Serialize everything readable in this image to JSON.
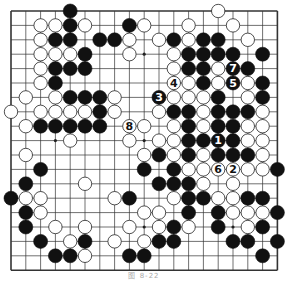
{
  "diagram": {
    "caption": "图 8-22",
    "board_size": 19,
    "visible_cols": 19,
    "visible_rows": 18,
    "grid": {
      "left": 11,
      "top": 11,
      "dx": 14.8,
      "dy": 14.4
    },
    "colors": {
      "line": "#333333",
      "black": "#111111",
      "white": "#ffffff",
      "star": "#222222",
      "background": "#ffffff"
    },
    "star_points": [
      [
        3,
        3
      ],
      [
        9,
        3
      ],
      [
        15,
        3
      ],
      [
        3,
        9
      ],
      [
        9,
        9
      ],
      [
        15,
        9
      ],
      [
        3,
        15
      ],
      [
        9,
        15
      ],
      [
        15,
        15
      ]
    ],
    "black_stones": [
      [
        4,
        0
      ],
      [
        4,
        1
      ],
      [
        8,
        1
      ],
      [
        3,
        2
      ],
      [
        4,
        2
      ],
      [
        6,
        2
      ],
      [
        7,
        2
      ],
      [
        11,
        2
      ],
      [
        13,
        2
      ],
      [
        14,
        2
      ],
      [
        5,
        3
      ],
      [
        12,
        3
      ],
      [
        13,
        3
      ],
      [
        14,
        3
      ],
      [
        15,
        3
      ],
      [
        17,
        3
      ],
      [
        3,
        4
      ],
      [
        4,
        4
      ],
      [
        5,
        4
      ],
      [
        12,
        4
      ],
      [
        13,
        4
      ],
      [
        16,
        4
      ],
      [
        3,
        5
      ],
      [
        13,
        5
      ],
      [
        17,
        5
      ],
      [
        4,
        6
      ],
      [
        5,
        6
      ],
      [
        6,
        6
      ],
      [
        14,
        6
      ],
      [
        17,
        6
      ],
      [
        6,
        7
      ],
      [
        11,
        7
      ],
      [
        12,
        7
      ],
      [
        14,
        7
      ],
      [
        15,
        7
      ],
      [
        16,
        7
      ],
      [
        2,
        8
      ],
      [
        3,
        8
      ],
      [
        4,
        8
      ],
      [
        5,
        8
      ],
      [
        6,
        8
      ],
      [
        12,
        8
      ],
      [
        14,
        8
      ],
      [
        15,
        8
      ],
      [
        12,
        9
      ],
      [
        13,
        9
      ],
      [
        15,
        9
      ],
      [
        10,
        10
      ],
      [
        12,
        10
      ],
      [
        14,
        10
      ],
      [
        15,
        10
      ],
      [
        16,
        10
      ],
      [
        2,
        11
      ],
      [
        9,
        11
      ],
      [
        11,
        11
      ],
      [
        18,
        11
      ],
      [
        1,
        12
      ],
      [
        10,
        12
      ],
      [
        11,
        12
      ],
      [
        12,
        12
      ],
      [
        0,
        13
      ],
      [
        8,
        13
      ],
      [
        12,
        13
      ],
      [
        13,
        13
      ],
      [
        16,
        13
      ],
      [
        17,
        13
      ],
      [
        1,
        14
      ],
      [
        12,
        14
      ],
      [
        14,
        14
      ],
      [
        18,
        14
      ],
      [
        1,
        15
      ],
      [
        11,
        15
      ],
      [
        14,
        15
      ],
      [
        17,
        15
      ],
      [
        2,
        16
      ],
      [
        5,
        16
      ],
      [
        10,
        16
      ],
      [
        11,
        16
      ],
      [
        15,
        16
      ],
      [
        16,
        16
      ],
      [
        18,
        16
      ],
      [
        3,
        17
      ],
      [
        4,
        17
      ],
      [
        8,
        17
      ],
      [
        9,
        17
      ],
      [
        17,
        17
      ]
    ],
    "white_stones": [
      [
        14,
        0
      ],
      [
        2,
        1
      ],
      [
        3,
        1
      ],
      [
        5,
        1
      ],
      [
        9,
        1
      ],
      [
        12,
        1
      ],
      [
        15,
        1
      ],
      [
        2,
        2
      ],
      [
        8,
        2
      ],
      [
        10,
        2
      ],
      [
        12,
        2
      ],
      [
        16,
        2
      ],
      [
        2,
        3
      ],
      [
        3,
        3
      ],
      [
        4,
        3
      ],
      [
        8,
        3
      ],
      [
        11,
        3
      ],
      [
        2,
        4
      ],
      [
        11,
        4
      ],
      [
        14,
        4
      ],
      [
        2,
        5
      ],
      [
        12,
        5
      ],
      [
        14,
        5
      ],
      [
        16,
        5
      ],
      [
        1,
        6
      ],
      [
        3,
        6
      ],
      [
        7,
        6
      ],
      [
        11,
        6
      ],
      [
        12,
        6
      ],
      [
        13,
        6
      ],
      [
        16,
        6
      ],
      [
        0,
        7
      ],
      [
        2,
        7
      ],
      [
        3,
        7
      ],
      [
        4,
        7
      ],
      [
        5,
        7
      ],
      [
        7,
        7
      ],
      [
        10,
        7
      ],
      [
        13,
        7
      ],
      [
        17,
        7
      ],
      [
        1,
        8
      ],
      [
        9,
        8
      ],
      [
        11,
        8
      ],
      [
        13,
        8
      ],
      [
        16,
        8
      ],
      [
        17,
        8
      ],
      [
        4,
        9
      ],
      [
        8,
        9
      ],
      [
        10,
        9
      ],
      [
        11,
        9
      ],
      [
        16,
        9
      ],
      [
        17,
        9
      ],
      [
        1,
        10
      ],
      [
        9,
        10
      ],
      [
        11,
        10
      ],
      [
        13,
        10
      ],
      [
        17,
        10
      ],
      [
        12,
        11
      ],
      [
        13,
        11
      ],
      [
        16,
        11
      ],
      [
        17,
        11
      ],
      [
        5,
        12
      ],
      [
        13,
        12
      ],
      [
        15,
        12
      ],
      [
        1,
        13
      ],
      [
        2,
        13
      ],
      [
        7,
        13
      ],
      [
        11,
        13
      ],
      [
        14,
        13
      ],
      [
        15,
        13
      ],
      [
        2,
        14
      ],
      [
        9,
        14
      ],
      [
        10,
        14
      ],
      [
        15,
        14
      ],
      [
        16,
        14
      ],
      [
        17,
        14
      ],
      [
        3,
        15
      ],
      [
        5,
        15
      ],
      [
        8,
        15
      ],
      [
        10,
        15
      ],
      [
        12,
        15
      ],
      [
        16,
        15
      ],
      [
        4,
        16
      ],
      [
        7,
        16
      ],
      [
        9,
        16
      ],
      [
        5,
        17
      ]
    ],
    "numbered_moves": [
      {
        "n": "1",
        "color": "black",
        "col": 14,
        "row": 9
      },
      {
        "n": "2",
        "color": "white",
        "col": 15,
        "row": 11
      },
      {
        "n": "3",
        "color": "black",
        "col": 10,
        "row": 6
      },
      {
        "n": "4",
        "color": "white",
        "col": 11,
        "row": 5
      },
      {
        "n": "5",
        "color": "black",
        "col": 15,
        "row": 5
      },
      {
        "n": "6",
        "color": "white",
        "col": 14,
        "row": 11
      },
      {
        "n": "7",
        "color": "black",
        "col": 15,
        "row": 4
      },
      {
        "n": "8",
        "color": "white",
        "col": 8,
        "row": 8
      }
    ]
  }
}
